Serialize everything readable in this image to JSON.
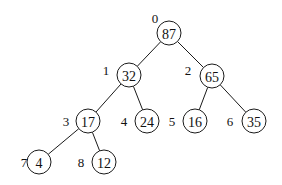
{
  "diagram": {
    "type": "binary-heap-tree",
    "node_radius": 12,
    "stroke_color": "#1a1a1a",
    "nodes": [
      {
        "index": "0",
        "value": "87",
        "cx": 169,
        "cy": 33,
        "lx": 155,
        "ly": 18
      },
      {
        "index": "1",
        "value": "32",
        "cx": 129,
        "cy": 75,
        "lx": 106,
        "ly": 70
      },
      {
        "index": "2",
        "value": "65",
        "cx": 212,
        "cy": 76,
        "lx": 188,
        "ly": 70
      },
      {
        "index": "3",
        "value": "17",
        "cx": 88,
        "cy": 121,
        "lx": 66,
        "ly": 121
      },
      {
        "index": "4",
        "value": "24",
        "cx": 147,
        "cy": 121,
        "lx": 124,
        "ly": 121
      },
      {
        "index": "5",
        "value": "16",
        "cx": 195,
        "cy": 121,
        "lx": 172,
        "ly": 121
      },
      {
        "index": "6",
        "value": "35",
        "cx": 254,
        "cy": 121,
        "lx": 230,
        "ly": 121
      },
      {
        "index": "7",
        "value": "4",
        "cx": 39,
        "cy": 162,
        "lx": 24,
        "ly": 162
      },
      {
        "index": "8",
        "value": "12",
        "cx": 104,
        "cy": 162,
        "lx": 81,
        "ly": 162
      }
    ],
    "edges": [
      {
        "from": 0,
        "to": 1
      },
      {
        "from": 0,
        "to": 2
      },
      {
        "from": 1,
        "to": 3
      },
      {
        "from": 1,
        "to": 4
      },
      {
        "from": 2,
        "to": 5
      },
      {
        "from": 2,
        "to": 6
      },
      {
        "from": 3,
        "to": 7
      },
      {
        "from": 3,
        "to": 8
      }
    ]
  }
}
